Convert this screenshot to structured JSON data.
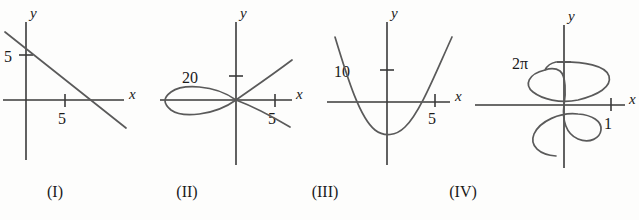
{
  "figure": {
    "background_color": "#fdfdfc",
    "curve_color": "#5a5a5a",
    "axis_color": "#3a3a3a",
    "text_color": "#1a1a1a"
  },
  "panels": [
    {
      "caption": "(I)",
      "caption_x": 20,
      "x_axis_label": "x",
      "y_axis_label": "y",
      "ticks": [
        {
          "axis": "y",
          "label": "5",
          "label_x": 4,
          "label_y": 62,
          "tick_x1": 19,
          "tick_y1": 55,
          "tick_x2": 33,
          "tick_y2": 55
        },
        {
          "axis": "x",
          "label": "5",
          "label_x": 58,
          "label_y": 124,
          "tick_x1": 65,
          "tick_y1": 94,
          "tick_x2": 65,
          "tick_y2": 107
        }
      ],
      "axes": {
        "x_line": {
          "x1": 3,
          "y1": 100,
          "x2": 124,
          "y2": 100
        },
        "y_line": {
          "x1": 26,
          "y1": 22,
          "x2": 26,
          "y2": 160
        },
        "x_label_pos": {
          "x": 129,
          "y": 99
        },
        "y_label_pos": {
          "x": 30,
          "y": 18
        }
      },
      "curve_path": "M 5,32 L 126,128"
    },
    {
      "caption": "(II)",
      "caption_x": 152,
      "x_axis_label": "x",
      "y_axis_label": "y",
      "ticks": [
        {
          "axis": "y",
          "label": "20",
          "label_x": 182,
          "label_y": 83,
          "tick_x1": 229,
          "tick_y1": 76,
          "tick_x2": 243,
          "tick_y2": 76
        },
        {
          "axis": "x",
          "label": "5",
          "label_x": 268,
          "label_y": 124,
          "tick_x1": 275,
          "tick_y1": 94,
          "tick_x2": 275,
          "tick_y2": 107
        }
      ],
      "axes": {
        "x_line": {
          "x1": 160,
          "y1": 100,
          "x2": 292,
          "y2": 100
        },
        "y_line": {
          "x1": 236,
          "y1": 22,
          "x2": 236,
          "y2": 165
        },
        "x_label_pos": {
          "x": 296,
          "y": 99
        },
        "y_label_pos": {
          "x": 240,
          "y": 18
        }
      },
      "curve_path": "M 236,100 C 214,84 182,84 171,92 C 163,98 163,103 171,110 C 182,118 214,116 236,100 C 250,90 268,78 292,60 M 236,100 C 252,106 268,114 290,127"
    },
    {
      "caption": "(III)",
      "caption_x": 290,
      "x_axis_label": "x",
      "y_axis_label": "y",
      "ticks": [
        {
          "axis": "y",
          "label": "10",
          "label_x": 334,
          "label_y": 77,
          "tick_x1": 380,
          "tick_y1": 70,
          "tick_x2": 394,
          "tick_y2": 70
        },
        {
          "axis": "x",
          "label": "5",
          "label_x": 428,
          "label_y": 124,
          "tick_x1": 435,
          "tick_y1": 94,
          "tick_x2": 435,
          "tick_y2": 107
        }
      ],
      "axes": {
        "x_line": {
          "x1": 327,
          "y1": 102,
          "x2": 450,
          "y2": 102
        },
        "y_line": {
          "x1": 387,
          "y1": 22,
          "x2": 387,
          "y2": 165
        },
        "x_label_pos": {
          "x": 455,
          "y": 101
        },
        "y_label_pos": {
          "x": 391,
          "y": 18
        }
      },
      "curve_path": "M 335,37 C 348,80 360,118 375,130 C 384,137 396,136 405,127 C 420,113 436,72 452,37"
    },
    {
      "caption": "(IV)",
      "caption_x": 428,
      "x_axis_label": "x",
      "y_axis_label": "y",
      "ticks": [
        {
          "axis": "y",
          "label": "2π",
          "label_x": 512,
          "label_y": 69,
          "tick_x1": 557,
          "tick_y1": 62,
          "tick_x2": 571,
          "tick_y2": 62
        },
        {
          "axis": "x",
          "label": "1",
          "label_x": 604,
          "label_y": 129,
          "tick_x1": 611,
          "tick_y1": 98,
          "tick_x2": 611,
          "tick_y2": 111
        }
      ],
      "axes": {
        "x_line": {
          "x1": 475,
          "y1": 105,
          "x2": 625,
          "y2": 105
        },
        "y_line": {
          "x1": 564,
          "y1": 25,
          "x2": 564,
          "y2": 168
        },
        "x_label_pos": {
          "x": 629,
          "y": 104
        },
        "y_label_pos": {
          "x": 568,
          "y": 21
        }
      },
      "curve_path": "M 556,62 C 585,61 606,66 609,76 C 612,87 598,95 578,100 C 560,104 542,99 533,92 C 524,85 528,74 545,70 C 551,68 557,69 560,71 M 556,62 C 551,63 547,66 545,70 M 560,71 C 566,76 566,93 564,105 C 562,120 566,134 578,139 C 590,144 600,138 601,130 C 602,121 592,115 578,114 C 560,112 540,121 534,134 C 529,146 540,155 556,156"
    }
  ]
}
